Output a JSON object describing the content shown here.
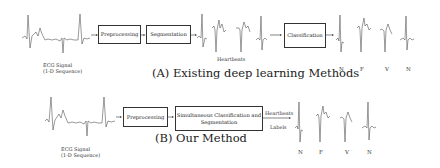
{
  "panel_a": {
    "input_label_line1": "ECG Signal",
    "input_label_line2": "(1-D Sequence)",
    "step1": "Preprocessing",
    "step2": "Segmentation",
    "intermediate_label": "Heartbeats",
    "step3": "Classification",
    "output_labels": [
      "N",
      "F",
      "V",
      "N"
    ],
    "caption": "(A) Existing deep learning Methods"
  },
  "panel_b": {
    "input_label_line1": "ECG Signal",
    "input_label_line2": "(1-D Sequence)",
    "step1": "Preprocessing",
    "step2_line1": "Simultaneous Classification and",
    "step2_line2": "Segmentation",
    "arrow_label_top": "Heartbeats",
    "arrow_label_bottom": "Labels",
    "output_labels": [
      "N",
      "F",
      "V",
      "N"
    ],
    "caption": "(B) Our Method"
  },
  "colors": {
    "stroke": "#333333",
    "trace": "#555555",
    "background": "#ffffff"
  }
}
